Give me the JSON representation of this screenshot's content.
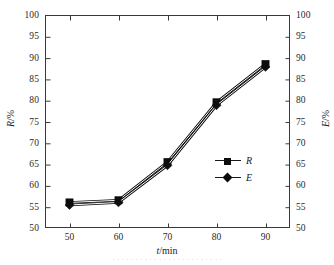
{
  "figure": {
    "caption_remnant": "· · · · · · · · · · · · · · · · · · · · · · · ·"
  },
  "axes": {
    "x": {
      "title_var": "t",
      "title_unit": "/min",
      "ticks": [
        "50",
        "60",
        "70",
        "80",
        "90"
      ]
    },
    "y_left": {
      "title_var": "R",
      "title_unit": "/%",
      "ticks": [
        "100",
        "95",
        "90",
        "85",
        "80",
        "75",
        "70",
        "65",
        "60",
        "55",
        "50"
      ]
    },
    "y_right": {
      "title_var": "E",
      "title_unit": "/%",
      "ticks": [
        "100",
        "95",
        "90",
        "85",
        "80",
        "75",
        "70",
        "65",
        "60",
        "55",
        "50"
      ]
    }
  },
  "legend": {
    "items": [
      {
        "label": "R",
        "marker": "filled-square-marker"
      },
      {
        "label": "E",
        "marker": "filled-diamond-marker"
      }
    ]
  },
  "chart_data": {
    "type": "line",
    "title": "",
    "subtitle": "",
    "xlabel": "t/min",
    "ylabel": "R/%",
    "y2label": "E/%",
    "x": [
      50,
      60,
      70,
      80,
      90
    ],
    "xlim": [
      45,
      95
    ],
    "ylim": [
      50,
      100
    ],
    "y2lim": [
      50,
      100
    ],
    "xticks": [
      50,
      60,
      70,
      80,
      90
    ],
    "yticks": [
      50,
      55,
      60,
      65,
      70,
      75,
      80,
      85,
      90,
      95,
      100
    ],
    "y2ticks": [
      50,
      55,
      60,
      65,
      70,
      75,
      80,
      85,
      90,
      95,
      100
    ],
    "grid": false,
    "legend_position": "center-right-inside",
    "color": "#0d0d0d",
    "series": [
      {
        "name": "R",
        "axis": "left",
        "marker": "square",
        "values": [
          56.0,
          56.5,
          65.5,
          79.5,
          88.5
        ]
      },
      {
        "name": "E",
        "axis": "right",
        "marker": "diamond",
        "values": [
          55.4,
          56.0,
          64.7,
          78.8,
          87.8
        ]
      }
    ],
    "annotations": []
  }
}
